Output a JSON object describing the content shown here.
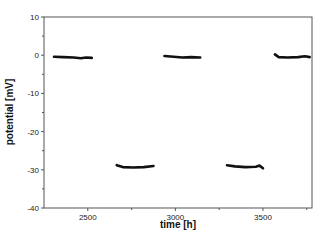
{
  "chart_data": {
    "type": "line",
    "title": "",
    "xlabel": "time [h]",
    "ylabel": "potential [mV]",
    "xlim": [
      2250,
      3780
    ],
    "ylim": [
      -40,
      10
    ],
    "x_ticks": [
      2500,
      3000,
      3500
    ],
    "x_minor_ticks": [
      2750,
      3250,
      3750
    ],
    "y_ticks": [
      10,
      0,
      -10,
      -20,
      -30,
      -40
    ],
    "y_minor_ticks": [
      5,
      -5,
      -15,
      -25,
      -35
    ],
    "grid": false,
    "legend": null,
    "series": [
      {
        "name": "potential",
        "segments": [
          {
            "x": [
              2307,
              2360,
              2420,
              2460,
              2490,
              2523
            ],
            "y": [
              -0.4,
              -0.5,
              -0.6,
              -0.8,
              -0.6,
              -0.7
            ]
          },
          {
            "x": [
              2665,
              2700,
              2760,
              2820,
              2875
            ],
            "y": [
              -28.8,
              -29.3,
              -29.4,
              -29.3,
              -29.0
            ]
          },
          {
            "x": [
              2938,
              2990,
              3040,
              3090,
              3142
            ],
            "y": [
              -0.2,
              -0.4,
              -0.6,
              -0.5,
              -0.6
            ]
          },
          {
            "x": [
              3295,
              3340,
              3400,
              3460,
              3480,
              3500
            ],
            "y": [
              -28.8,
              -29.1,
              -29.3,
              -29.2,
              -28.9,
              -29.6
            ]
          },
          {
            "x": [
              3568,
              3590,
              3640,
              3700,
              3740,
              3767
            ],
            "y": [
              0.2,
              -0.5,
              -0.6,
              -0.5,
              -0.3,
              -0.5
            ]
          }
        ]
      }
    ]
  },
  "colors": {
    "axis": "#555555",
    "data": "#111111"
  }
}
